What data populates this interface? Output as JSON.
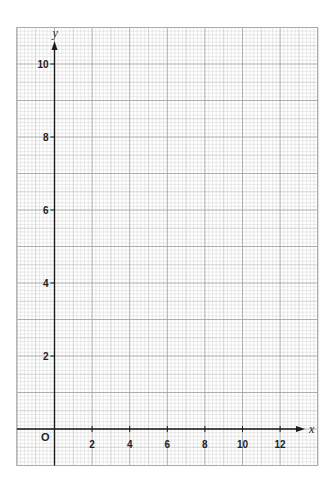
{
  "chart_data": {
    "type": "scatter",
    "title": "",
    "xlabel": "x",
    "ylabel": "y",
    "origin_label": "O",
    "xlim": [
      -2,
      14
    ],
    "ylim": [
      -1,
      11
    ],
    "x_ticks": [
      2,
      4,
      6,
      8,
      10,
      12
    ],
    "y_ticks": [
      2,
      4,
      6,
      8,
      10
    ],
    "x_tick_labels": [
      "2",
      "4",
      "6",
      "8",
      "10",
      "12"
    ],
    "y_tick_labels": [
      "2",
      "4",
      "6",
      "8",
      "10"
    ],
    "grid": true,
    "series": [],
    "colors": {
      "major_grid": "#9a9a9a",
      "mid_grid": "#b8b8b8",
      "minor_grid": "#d4d4d4",
      "axis": "#1a1a1a"
    }
  }
}
